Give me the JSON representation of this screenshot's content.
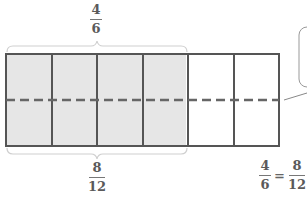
{
  "diagram": {
    "type": "fraction-area-model",
    "total_columns": 6,
    "shaded_columns": 4,
    "rows_after_split": 2,
    "shade_color": "#e6e6e6",
    "line_color": "#555555",
    "dash_color": "#666666",
    "brace_color": "#cccccc"
  },
  "top_label": {
    "numerator": "4",
    "denominator": "6"
  },
  "bottom_label": {
    "numerator": "8",
    "denominator": "12"
  },
  "equation": {
    "left": {
      "numerator": "4",
      "denominator": "6"
    },
    "sign": "=",
    "right": {
      "numerator": "8",
      "denominator": "12"
    }
  },
  "callout": {
    "text": ""
  }
}
